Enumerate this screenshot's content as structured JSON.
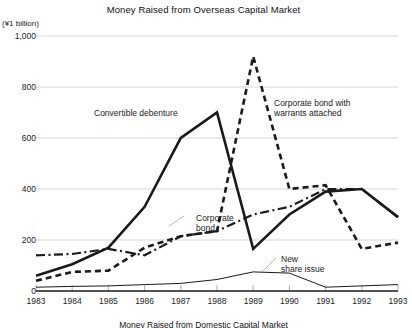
{
  "chart_data": {
    "type": "line",
    "title": "Money Raised from Overseas Capital Market",
    "caption": "Money Raised from Domestic Capital Market",
    "unit_label": "(¥1 billion)",
    "xlabel": "",
    "ylabel": "",
    "categories": [
      "1983",
      "1984",
      "1985",
      "1986",
      "1987",
      "1988",
      "1989",
      "1990",
      "1991",
      "1992",
      "1993"
    ],
    "yticks": [
      "0",
      "200",
      "400",
      "600",
      "800",
      "1,000"
    ],
    "ytick_values": [
      0,
      200,
      400,
      600,
      800,
      1000
    ],
    "ylim": [
      0,
      1000
    ],
    "grid": true,
    "legend": "inline annotations",
    "series": [
      {
        "name": "Convertible debenture",
        "style": "solid-thick",
        "color": "#1a1a1a",
        "values": [
          60,
          105,
          170,
          330,
          600,
          700,
          165,
          300,
          390,
          400,
          290
        ]
      },
      {
        "name": "Corporate bond with warrants attached",
        "style": "dashed",
        "color": "#1a1a1a",
        "values": [
          40,
          75,
          80,
          170,
          215,
          235,
          920,
          400,
          415,
          165,
          190
        ]
      },
      {
        "name": "Corporate bond",
        "style": "dash-dot",
        "color": "#1a1a1a",
        "values": [
          140,
          145,
          165,
          140,
          215,
          235,
          300,
          330,
          400,
          400,
          290
        ]
      },
      {
        "name": "New share issue",
        "style": "solid-thin",
        "color": "#1a1a1a",
        "values": [
          15,
          18,
          20,
          25,
          30,
          45,
          75,
          70,
          15,
          20,
          25
        ]
      }
    ],
    "annotations": [
      {
        "name": "convertible-debenture-label",
        "text": "Convertible debenture",
        "x": 94,
        "y": 108
      },
      {
        "name": "corporate-bond-with-warrants-label",
        "text": "Corporate bond with\nwarrants attached",
        "x": 274,
        "y": 98
      },
      {
        "name": "corporate-bond-label",
        "text": "Corporate\nbond",
        "x": 196,
        "y": 213
      },
      {
        "name": "new-share-issue-label",
        "text": "New\nshare issue",
        "x": 281,
        "y": 254
      }
    ]
  }
}
